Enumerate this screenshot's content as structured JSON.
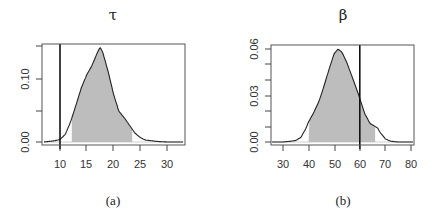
{
  "chart_data": [
    {
      "type": "area",
      "panel": "(a)",
      "title": "τ",
      "xlabel": "",
      "ylabel": "",
      "xlim": [
        7,
        33
      ],
      "ylim": [
        0,
        0.15
      ],
      "x_ticks": [
        10,
        15,
        20,
        25,
        30
      ],
      "y_ticks": [
        0.0,
        0.05,
        0.1,
        0.15
      ],
      "y_tick_labels": [
        "0.00",
        "",
        "0.10",
        ""
      ],
      "grid": false,
      "series": [
        {
          "name": "posterior density",
          "x": [
            7,
            8,
            9,
            10,
            11,
            12,
            13,
            14,
            15,
            16,
            17,
            17.5,
            18,
            19,
            20,
            21,
            22,
            23,
            24,
            25,
            26,
            28,
            30,
            33
          ],
          "values": [
            0.0,
            0.001,
            0.002,
            0.004,
            0.012,
            0.032,
            0.058,
            0.085,
            0.105,
            0.12,
            0.14,
            0.148,
            0.14,
            0.11,
            0.075,
            0.048,
            0.038,
            0.026,
            0.014,
            0.007,
            0.003,
            0.001,
            0.0,
            0.0
          ]
        }
      ],
      "shaded_interval": [
        12.2,
        23.5
      ],
      "vertical_line": 10,
      "caption": "(a)"
    },
    {
      "type": "area",
      "panel": "(b)",
      "title": "β",
      "xlabel": "",
      "ylabel": "",
      "xlim": [
        25,
        82
      ],
      "ylim": [
        0,
        0.06
      ],
      "x_ticks": [
        30,
        40,
        50,
        60,
        70,
        80
      ],
      "y_ticks": [
        0.0,
        0.01,
        0.02,
        0.03,
        0.04,
        0.05,
        0.06
      ],
      "y_tick_labels": [
        "0.00",
        "",
        "",
        "0.03",
        "",
        "",
        "0.06"
      ],
      "grid": false,
      "series": [
        {
          "name": "posterior density",
          "x": [
            25,
            30,
            33,
            35,
            37,
            39,
            40,
            42,
            44,
            46,
            48,
            50,
            51.5,
            53,
            55,
            57,
            59,
            60,
            62,
            64,
            65,
            66,
            67,
            68,
            70,
            72,
            75,
            82
          ],
          "values": [
            0.0,
            0.0,
            0.0005,
            0.001,
            0.003,
            0.009,
            0.013,
            0.019,
            0.026,
            0.036,
            0.047,
            0.057,
            0.06,
            0.058,
            0.051,
            0.042,
            0.033,
            0.028,
            0.018,
            0.012,
            0.011,
            0.01,
            0.009,
            0.006,
            0.002,
            0.0005,
            0.0,
            0.0
          ]
        }
      ],
      "shaded_interval": [
        40,
        66
      ],
      "vertical_line": 60,
      "caption": "(b)"
    }
  ],
  "panels": {
    "a": {
      "title": "τ",
      "caption": "(a)",
      "x_tick_labels": [
        "10",
        "15",
        "20",
        "25",
        "30"
      ],
      "y_tick_labels": [
        "0.00",
        "0.10"
      ]
    },
    "b": {
      "title": "β",
      "caption": "(b)",
      "x_tick_labels": [
        "30",
        "40",
        "50",
        "60",
        "70",
        "80"
      ],
      "y_tick_labels": [
        "0.00",
        "0.03",
        "0.06"
      ]
    }
  },
  "colors": {
    "shade": "#bdbdbd",
    "curve": "#222222",
    "vline": "#111111",
    "frame": "#555555"
  }
}
